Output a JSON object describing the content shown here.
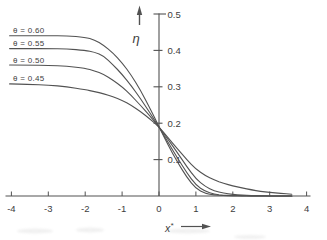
{
  "canvas": {
    "background": "#ffffff",
    "line_color": "#525252",
    "text_color": "#3d3d3d"
  },
  "chart_data": {
    "type": "line",
    "title": "",
    "xlabel": "x*",
    "xlabel_base": "x",
    "xlabel_sup": "*",
    "ylabel": "η",
    "xlim": [
      -4,
      4
    ],
    "ylim": [
      0,
      0.5
    ],
    "grid": false,
    "legend_position": "inline-left-above-curves",
    "x_ticks": [
      -4,
      -3,
      -2,
      -1,
      0,
      1,
      2,
      3,
      4
    ],
    "x_tick_labels": [
      "-4",
      "-3",
      "-2",
      "-1",
      "0",
      "1",
      "2",
      "3",
      "4"
    ],
    "y_ticks": [
      0.1,
      0.2,
      0.3,
      0.4,
      0.5
    ],
    "y_tick_labels": [
      "0.1",
      "0.2",
      "0.3",
      "0.4",
      "0.5"
    ],
    "crossing_point": {
      "x": 0,
      "eta": 0.19
    },
    "x": [
      -4.05,
      -3.5,
      -3,
      -2.5,
      -2,
      -1.75,
      -1.5,
      -1.25,
      -1,
      -0.75,
      -0.5,
      -0.25,
      0,
      0.25,
      0.5,
      0.75,
      1,
      1.25,
      1.5,
      1.75,
      2,
      2.25,
      2.5,
      2.75,
      3,
      3.3,
      3.6
    ],
    "series": [
      {
        "label": "θ = 0.60",
        "theta": 0.6,
        "values": [
          0.44,
          0.44,
          0.44,
          0.44,
          0.436,
          0.429,
          0.414,
          0.393,
          0.366,
          0.332,
          0.29,
          0.242,
          0.19,
          0.139,
          0.093,
          0.052,
          0.02,
          0.007,
          0.003,
          0.001,
          0.001,
          0.0,
          0.0,
          0.0,
          0.0,
          0.0,
          0.0
        ]
      },
      {
        "label": "θ = 0.55",
        "theta": 0.55,
        "values": [
          0.405,
          0.405,
          0.405,
          0.404,
          0.4,
          0.395,
          0.385,
          0.361,
          0.334,
          0.303,
          0.267,
          0.229,
          0.19,
          0.147,
          0.105,
          0.064,
          0.03,
          0.013,
          0.005,
          0.002,
          0.001,
          0.001,
          0.0,
          0.0,
          0.0,
          0.0,
          0.0
        ]
      },
      {
        "label": "θ = 0.50",
        "theta": 0.5,
        "values": [
          0.36,
          0.36,
          0.359,
          0.357,
          0.351,
          0.344,
          0.334,
          0.318,
          0.3,
          0.276,
          0.249,
          0.22,
          0.19,
          0.155,
          0.119,
          0.081,
          0.047,
          0.026,
          0.014,
          0.008,
          0.004,
          0.002,
          0.001,
          0.001,
          0.0,
          0.0,
          0.0
        ]
      },
      {
        "label": "θ = 0.45",
        "theta": 0.45,
        "values": [
          0.308,
          0.307,
          0.305,
          0.3,
          0.292,
          0.287,
          0.281,
          0.273,
          0.263,
          0.249,
          0.232,
          0.212,
          0.19,
          0.16,
          0.13,
          0.1,
          0.074,
          0.056,
          0.044,
          0.035,
          0.028,
          0.022,
          0.017,
          0.013,
          0.01,
          0.007,
          0.005
        ]
      }
    ]
  }
}
